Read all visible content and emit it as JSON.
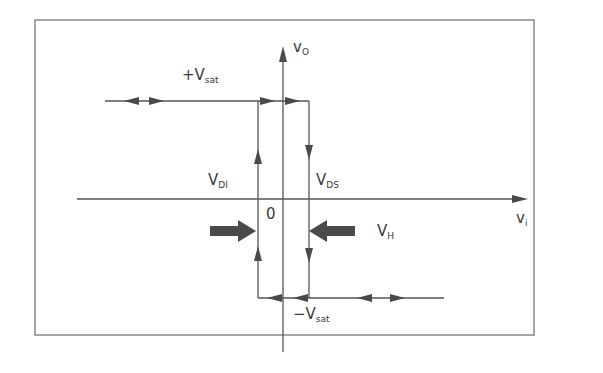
{
  "diagram": {
    "type": "hysteresis-transfer-characteristic",
    "colors": {
      "line": "#555555",
      "arrow_fill": "#4a4a4a",
      "text": "#3a3a3a",
      "frame": "#777777"
    },
    "axes": {
      "y_axis": {
        "label_main": "v",
        "label_sub": "O"
      },
      "x_axis": {
        "label_main": "v",
        "label_sub": "i"
      },
      "origin_label": "0"
    },
    "levels": {
      "positive_saturation": {
        "prefix": "+",
        "main": "V",
        "sub": "sat"
      },
      "negative_saturation": {
        "prefix": "−",
        "main": "V",
        "sub": "sat"
      }
    },
    "thresholds": {
      "lower": {
        "main": "V",
        "sub": "DI"
      },
      "upper": {
        "main": "V",
        "sub": "DS"
      }
    },
    "hysteresis_width": {
      "main": "V",
      "sub": "H"
    }
  }
}
